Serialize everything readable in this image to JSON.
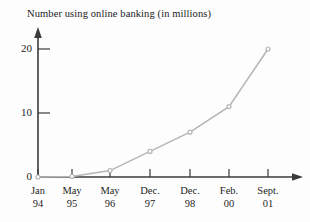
{
  "chart_data": {
    "type": "line",
    "title": "Number using online banking (in millions)",
    "xlabel": "",
    "ylabel": "",
    "categories": [
      "Jan 94",
      "May 95",
      "May 96",
      "Dec. 97",
      "Dec. 98",
      "Feb. 00",
      "Sept. 01"
    ],
    "category_months": [
      "Jan",
      "May",
      "May",
      "Dec.",
      "Dec.",
      "Feb.",
      "Sept."
    ],
    "category_years": [
      "94",
      "95",
      "96",
      "97",
      "98",
      "00",
      "01"
    ],
    "values": [
      0,
      0.1,
      1,
      4,
      7,
      11,
      20
    ],
    "ylim": [
      0,
      22
    ],
    "yticks": [
      0,
      10,
      20
    ],
    "ytick_labels": [
      "0",
      "10",
      "20"
    ],
    "grid": false,
    "legend": null,
    "series": [
      {
        "name": "Number using online banking (in millions)",
        "values": [
          0,
          0.1,
          1,
          4,
          7,
          11,
          20
        ]
      }
    ],
    "marker": "open-circle",
    "line_color": "#b5b5b5",
    "marker_color": "#b5b5b5",
    "axis_color": "#3a3a3a"
  },
  "axes": {
    "y_axis_name": "y-axis-with-arrow",
    "x_axis_name": "x-axis-with-arrow"
  }
}
